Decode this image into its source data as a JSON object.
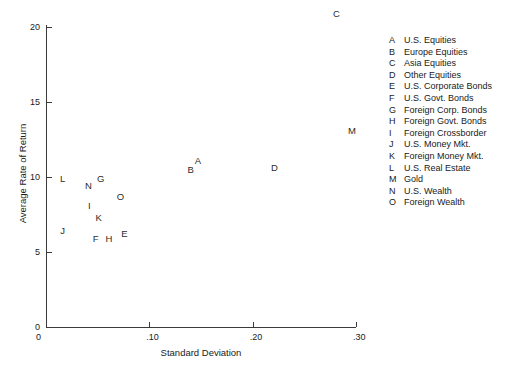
{
  "chart_data": {
    "type": "scatter",
    "title": "",
    "xlabel": "Standard Deviation",
    "ylabel": "Average Rate of Return",
    "xlim": [
      0,
      0.3
    ],
    "ylim": [
      0,
      20
    ],
    "grid": false,
    "legend_position": "right",
    "xticks": [
      {
        "value": 0,
        "label": "0"
      },
      {
        "value": 0.1,
        "label": ".10"
      },
      {
        "value": 0.2,
        "label": ".20"
      },
      {
        "value": 0.3,
        "label": ".30"
      }
    ],
    "yticks": [
      {
        "value": 0,
        "label": "0"
      },
      {
        "value": 5,
        "label": "5"
      },
      {
        "value": 10,
        "label": "10"
      },
      {
        "value": 15,
        "label": "15"
      },
      {
        "value": 20,
        "label": "20"
      }
    ],
    "point_marker_style": "letter-label",
    "points": [
      {
        "key": "A",
        "name": "U.S. Equities",
        "x": 0.147,
        "y": 11.1
      },
      {
        "key": "B",
        "name": "Europe Equities",
        "x": 0.14,
        "y": 10.5
      },
      {
        "key": "C",
        "name": "Asia Equities",
        "x": 0.281,
        "y": 20.9
      },
      {
        "key": "D",
        "name": "Other Equities",
        "x": 0.221,
        "y": 10.6
      },
      {
        "key": "E",
        "name": "U.S. Corporate Bonds",
        "x": 0.076,
        "y": 6.2
      },
      {
        "key": "F",
        "name": "U.S. Govt. Bonds",
        "x": 0.048,
        "y": 5.9
      },
      {
        "key": "G",
        "name": "Foreign Corp. Bonds",
        "x": 0.053,
        "y": 9.9
      },
      {
        "key": "H",
        "name": "Foreign Govt. Bonds",
        "x": 0.061,
        "y": 5.9
      },
      {
        "key": "I",
        "name": "Foreign Crossborder",
        "x": 0.042,
        "y": 8.1
      },
      {
        "key": "J",
        "name": "U.S. Money Mkt.",
        "x": 0.016,
        "y": 6.4
      },
      {
        "key": "K",
        "name": "Foreign Money Mkt.",
        "x": 0.051,
        "y": 7.3
      },
      {
        "key": "L",
        "name": "U.S. Real Estate",
        "x": 0.016,
        "y": 9.9
      },
      {
        "key": "M",
        "name": "Gold",
        "x": 0.296,
        "y": 13.1
      },
      {
        "key": "N",
        "name": "U.S. Wealth",
        "x": 0.041,
        "y": 9.4
      },
      {
        "key": "O",
        "name": "Foreign Wealth",
        "x": 0.072,
        "y": 8.7
      }
    ]
  },
  "legend": {
    "entries": [
      {
        "key": "A",
        "label": "U.S. Equities"
      },
      {
        "key": "B",
        "label": "Europe Equities"
      },
      {
        "key": "C",
        "label": "Asia Equities"
      },
      {
        "key": "D",
        "label": "Other Equities"
      },
      {
        "key": "E",
        "label": "U.S. Corporate Bonds"
      },
      {
        "key": "F",
        "label": "U.S. Govt. Bonds"
      },
      {
        "key": "G",
        "label": "Foreign Corp. Bonds"
      },
      {
        "key": "H",
        "label": "Foreign Govt. Bonds"
      },
      {
        "key": "I",
        "label": "Foreign Crossborder"
      },
      {
        "key": "J",
        "label": "U.S. Money Mkt."
      },
      {
        "key": "K",
        "label": "Foreign Money Mkt."
      },
      {
        "key": "L",
        "label": "U.S. Real Estate"
      },
      {
        "key": "M",
        "label": "Gold"
      },
      {
        "key": "N",
        "label": "U.S. Wealth"
      },
      {
        "key": "O",
        "label": "Foreign Wealth"
      }
    ]
  },
  "colors": {
    "background": "#ffffff",
    "axis": "#3a3a3a",
    "text": "#1a1a1a",
    "point_label": "#2b2b2b"
  }
}
